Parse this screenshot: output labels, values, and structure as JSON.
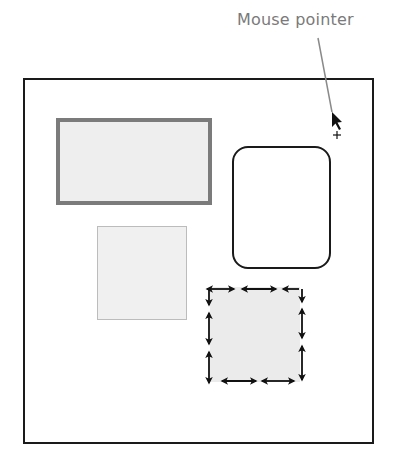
{
  "annotation": {
    "label": "Mouse pointer",
    "label_color": "#7a7a7a",
    "leader_line_color": "#8a8a8a"
  },
  "canvas": {
    "frame_color": "#1a1a1a",
    "shapes": [
      {
        "id": "gray-rectangle",
        "type": "rectangle",
        "fill": "#eeeeee",
        "border": "#7b7b7b"
      },
      {
        "id": "rounded-rectangle",
        "type": "rounded-rectangle",
        "fill": "#ffffff",
        "border": "#1a1a1a"
      },
      {
        "id": "light-square",
        "type": "square",
        "fill": "#f0f0f0",
        "border": "#bcbcbc"
      },
      {
        "id": "selected-square",
        "type": "square",
        "fill": "#ebebeb",
        "selected": true,
        "handles": "resize-arrows"
      }
    ]
  },
  "cursor": {
    "icon": "arrow-pointer-icon",
    "crosshair": "+"
  }
}
